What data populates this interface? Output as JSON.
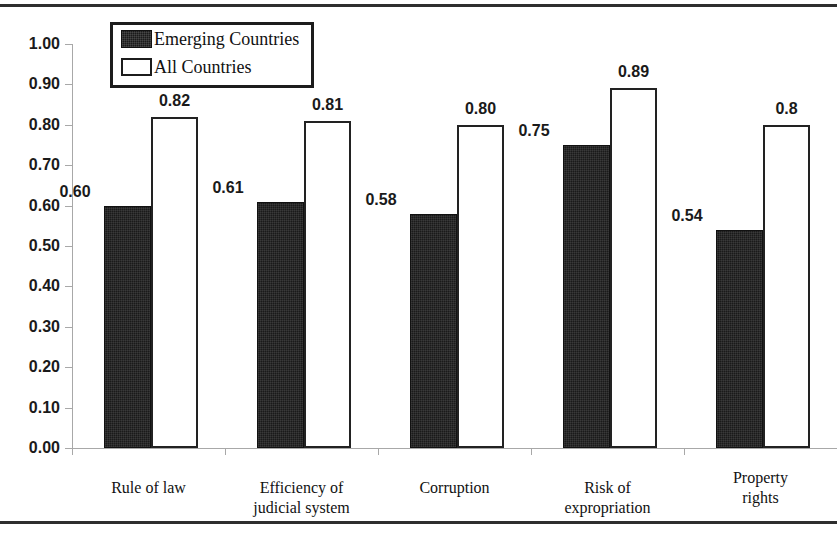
{
  "chart_data": {
    "type": "bar",
    "title": "",
    "subtitle": "",
    "xlabel": "",
    "ylabel": "",
    "ylim": [
      0.0,
      1.0
    ],
    "grid": false,
    "legend_position": "top-left-inside",
    "categories": [
      "Rule of law",
      "Efficiency of judicial system",
      "Corruption",
      "Risk of expropriation",
      "Property rights"
    ],
    "category_lines": [
      [
        "Rule of law"
      ],
      [
        "Efficiency of",
        "judicial system"
      ],
      [
        "Corruption"
      ],
      [
        "Risk of",
        "expropriation"
      ],
      [
        "Property",
        "rights"
      ]
    ],
    "series": [
      {
        "name": "Emerging Countries",
        "color": "#1a1a1a",
        "values": [
          0.6,
          0.61,
          0.58,
          0.75,
          0.54
        ],
        "labels": [
          "0.60",
          "0.61",
          "0.58",
          "0.75",
          "0.54"
        ]
      },
      {
        "name": "All Countries",
        "color": "#ffffff",
        "values": [
          0.82,
          0.81,
          0.8,
          0.89,
          0.8
        ],
        "labels": [
          "0.82",
          "0.81",
          "0.80",
          "0.89",
          "0.8"
        ]
      }
    ],
    "y_ticks": [
      "0.00",
      "0.10",
      "0.20",
      "0.30",
      "0.40",
      "0.50",
      "0.60",
      "0.70",
      "0.80",
      "0.90",
      "1.00"
    ],
    "y_tick_values": [
      0.0,
      0.1,
      0.2,
      0.3,
      0.4,
      0.5,
      0.6,
      0.7,
      0.8,
      0.9,
      1.0
    ]
  },
  "legend": {
    "items": [
      {
        "label": "Emerging Countries",
        "swatch": "filled-dark"
      },
      {
        "label": "All Countries",
        "swatch": "outline-white"
      }
    ]
  }
}
